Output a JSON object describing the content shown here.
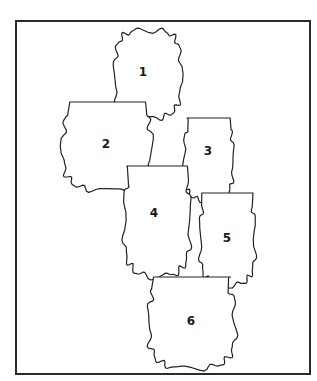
{
  "canvas": {
    "width": 317,
    "height": 381,
    "background": "#ffffff"
  },
  "frame": {
    "x": 16,
    "y": 21,
    "width": 294,
    "height": 353,
    "stroke": "#2a2a2a"
  },
  "shapes": [
    {
      "id": 1,
      "label": "1",
      "x": 115,
      "y": 30,
      "w": 66,
      "h": 88,
      "flatTop": false,
      "lx": 143,
      "ly": 72
    },
    {
      "id": 2,
      "label": "2",
      "x": 63,
      "y": 102,
      "w": 88,
      "h": 88,
      "flatTop": true,
      "lx": 106,
      "ly": 144
    },
    {
      "id": 3,
      "label": "3",
      "x": 184,
      "y": 118,
      "w": 49,
      "h": 82,
      "flatTop": true,
      "lx": 208,
      "ly": 151
    },
    {
      "id": 4,
      "label": "4",
      "x": 124,
      "y": 166,
      "w": 66,
      "h": 110,
      "flatTop": true,
      "lx": 154,
      "ly": 213
    },
    {
      "id": 5,
      "label": "5",
      "x": 200,
      "y": 193,
      "w": 55,
      "h": 92,
      "flatTop": true,
      "lx": 227,
      "ly": 238
    },
    {
      "id": 6,
      "label": "6",
      "x": 149,
      "y": 277,
      "w": 86,
      "h": 91,
      "flatTop": true,
      "lx": 191,
      "ly": 321
    }
  ]
}
